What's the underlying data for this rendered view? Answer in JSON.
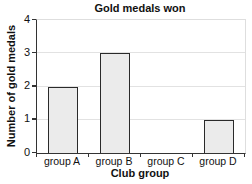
{
  "chart_data": {
    "type": "bar",
    "title": "Gold medals won",
    "xlabel": "Club group",
    "ylabel": "Number of gold medals",
    "categories": [
      "group A",
      "group B",
      "group C",
      "group D"
    ],
    "values": [
      2,
      3,
      0,
      1
    ],
    "ylim": [
      0,
      4
    ],
    "y_ticks": [
      0,
      1,
      2,
      3,
      4
    ],
    "grid": "horizontal-gridlines-on",
    "legend": "none",
    "colors": {
      "bar_fill": "#ebebeb",
      "bar_border": "#2a2a2a",
      "axis": "#333333",
      "gridline": "#e2e2e2",
      "plot_border_light": "#dedede",
      "text": "#111111",
      "background": "#ffffff"
    }
  }
}
